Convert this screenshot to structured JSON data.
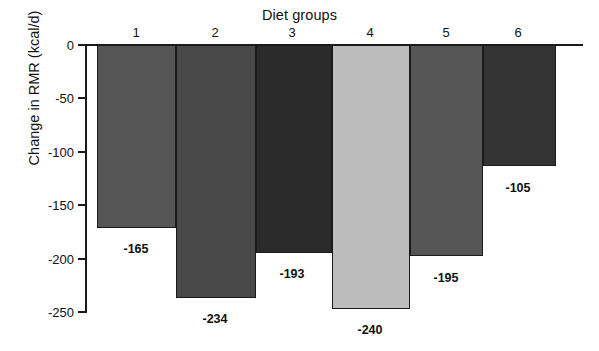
{
  "chart_data": {
    "type": "bar",
    "title": "Diet groups",
    "xlabel": "Diet groups",
    "ylabel": "Change in RMR (kcal/d)",
    "categories": [
      "1",
      "2",
      "3",
      "4",
      "5",
      "6"
    ],
    "values": [
      -165,
      -234,
      -193,
      -240,
      -195,
      -105
    ],
    "value_labels": [
      "-165",
      "-234",
      "-193",
      "-240",
      "-195",
      "-105"
    ],
    "ylim": [
      -250,
      0
    ],
    "ytick_labels": [
      "0",
      "-50",
      "-100",
      "-150",
      "-200",
      "-250"
    ],
    "ytick_values": [
      0,
      -50,
      -100,
      -150,
      -200,
      -250
    ],
    "grid": false,
    "legend": "none",
    "bar_colors": [
      "#565656",
      "#484848",
      "#2a2a2a",
      "#bcbcbc",
      "#565656",
      "#333333"
    ],
    "bar_edge_color": "#1b1b1b",
    "axis_color": "#1a1a1a",
    "background_color": "#ffffff",
    "bars": [
      {
        "category": "1",
        "value": -165,
        "label": "-165",
        "color": "#565656",
        "x0": 97,
        "x1": 176,
        "bottom_y": 228
      },
      {
        "category": "2",
        "value": -234,
        "label": "-234",
        "color": "#484848",
        "x0": 176,
        "x1": 256,
        "bottom_y": 298
      },
      {
        "category": "3",
        "value": -193,
        "label": "-193",
        "color": "#2a2a2a",
        "x0": 256,
        "x1": 332,
        "bottom_y": 253
      },
      {
        "category": "4",
        "value": -240,
        "label": "-240",
        "color": "#bcbcbc",
        "x0": 332,
        "x1": 410,
        "bottom_y": 309
      },
      {
        "category": "5",
        "value": -195,
        "label": "-195",
        "color": "#565656",
        "x0": 410,
        "x1": 483,
        "bottom_y": 256
      },
      {
        "category": "6",
        "value": -105,
        "label": "-105",
        "color": "#333333",
        "x0": 483,
        "x1": 556,
        "bottom_y": 166
      }
    ],
    "label_positions": [
      {
        "cx": 136,
        "y": 242
      },
      {
        "cx": 215,
        "y": 312
      },
      {
        "cx": 292,
        "y": 267
      },
      {
        "cx": 370,
        "y": 323
      },
      {
        "cx": 446,
        "y": 271
      },
      {
        "cx": 518,
        "y": 181
      }
    ],
    "group_label_positions": [
      {
        "cx": 136,
        "y": 25
      },
      {
        "cx": 215,
        "y": 25
      },
      {
        "cx": 292,
        "y": 25
      },
      {
        "cx": 370,
        "y": 25
      },
      {
        "cx": 446,
        "y": 25
      },
      {
        "cx": 518,
        "y": 25
      }
    ],
    "axis_geometry": {
      "zero_y": 45,
      "min_y": 312,
      "plot_left": 86,
      "plot_right": 583
    }
  }
}
